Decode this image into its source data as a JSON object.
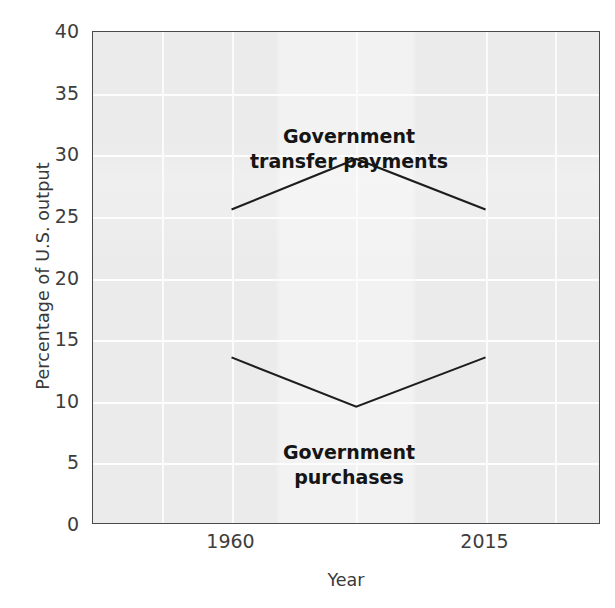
{
  "chart_data": {
    "type": "line",
    "title": "",
    "subtitle": "",
    "xlabel": "Year",
    "ylabel": "Percentage of U.S. output",
    "xlim": [
      1930,
      2040
    ],
    "ylim": [
      0,
      40
    ],
    "yticks": [
      40,
      35,
      30,
      25,
      20,
      15,
      10,
      5,
      0
    ],
    "ytick_labels": [
      "40",
      "35",
      "30",
      "25",
      "20",
      "15",
      "10",
      "5",
      "0"
    ],
    "xticks": [
      1960,
      2015
    ],
    "xtick_labels": [
      "1960",
      "2015"
    ],
    "grid": "white gridlines on light gray panel",
    "legend": "inline annotations, no legend box",
    "series": [
      {
        "name": "Government transfer payments",
        "label_position": "above-peak",
        "x": [
          1960,
          1987,
          2015
        ],
        "values": [
          25.6,
          29.7,
          25.6
        ]
      },
      {
        "name": "Government purchases",
        "label_position": "below-trough",
        "x": [
          1960,
          1987,
          2015
        ],
        "values": [
          13.6,
          9.6,
          13.6
        ]
      }
    ],
    "annotations": [
      {
        "id": "transfer",
        "line1": "Government",
        "line2": "transfer payments"
      },
      {
        "id": "purchases",
        "line1": "Government",
        "line2": "purchases"
      }
    ],
    "colors": {
      "panel": "#ebebeb",
      "gridline": "#ffffff",
      "line": "#1d1d1d",
      "axis_text": "#3d3d3d",
      "border": "#4a4a4a"
    }
  }
}
